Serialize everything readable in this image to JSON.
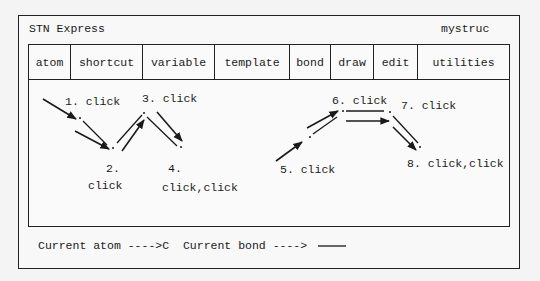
{
  "window": {
    "title": "STN Express",
    "structure_name": "mystruc"
  },
  "tabs": [
    {
      "label": "atom",
      "width": 42
    },
    {
      "label": "shortcut",
      "width": 72
    },
    {
      "label": "variable",
      "width": 72
    },
    {
      "label": "template",
      "width": 75
    },
    {
      "label": "bond",
      "width": 41
    },
    {
      "label": "draw",
      "width": 43
    },
    {
      "label": "edit",
      "width": 44
    },
    {
      "label": "utilities",
      "width": 0
    }
  ],
  "drawing": {
    "labels": [
      {
        "id": "step1",
        "text": "1. click",
        "x": 65,
        "y": 95
      },
      {
        "id": "step2-num",
        "text": "2.",
        "x": 106,
        "y": 162
      },
      {
        "id": "step2-action",
        "text": "click",
        "x": 88,
        "y": 179
      },
      {
        "id": "step3",
        "text": "3. click",
        "x": 142,
        "y": 92
      },
      {
        "id": "step4-num",
        "text": "4.",
        "x": 168,
        "y": 162
      },
      {
        "id": "step4-action",
        "text": "click,click",
        "x": 162,
        "y": 181
      },
      {
        "id": "step5",
        "text": "5. click",
        "x": 280,
        "y": 163
      },
      {
        "id": "step6",
        "text": "6. click",
        "x": 332,
        "y": 94
      },
      {
        "id": "step7",
        "text": "7. click",
        "x": 401,
        "y": 99
      },
      {
        "id": "step8",
        "text": "8. click,click",
        "x": 407,
        "y": 157
      }
    ],
    "atoms": [
      [
        80,
        118
      ],
      [
        113,
        148
      ],
      [
        144,
        113
      ],
      [
        181,
        147
      ],
      [
        310,
        137
      ],
      [
        343,
        111
      ],
      [
        390,
        112
      ],
      [
        420,
        147
      ]
    ],
    "bonds": [
      [
        83,
        121,
        107,
        145
      ],
      [
        117,
        143,
        142,
        115
      ],
      [
        147,
        117,
        177,
        146
      ],
      [
        313,
        134,
        337,
        117
      ],
      [
        346,
        111,
        384,
        111
      ],
      [
        393,
        116,
        418,
        143
      ]
    ],
    "arrows": [
      [
        43,
        99,
        76,
        119
      ],
      [
        75,
        131,
        109,
        149
      ],
      [
        122,
        151,
        144,
        120
      ],
      [
        157,
        112,
        182,
        141
      ],
      [
        276,
        161,
        302,
        142
      ],
      [
        307,
        128,
        338,
        111
      ],
      [
        346,
        121,
        389,
        121
      ],
      [
        393,
        127,
        416,
        150
      ]
    ]
  },
  "status": {
    "text": "Current atom ---->C  Current bond ---->",
    "current_atom": "C",
    "current_bond": "single"
  },
  "colors": {
    "ink": "#1a1a1a",
    "background": "#f4f4f4"
  }
}
